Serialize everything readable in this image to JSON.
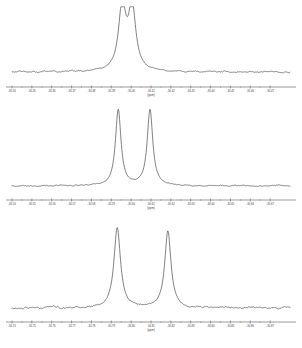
{
  "figure": {
    "background_color": "#ffffff",
    "trace_color": "#4a4a52",
    "axis_color": "#55555c",
    "width": 302,
    "height": 348
  },
  "chart_data": [
    {
      "type": "line",
      "name": "panel-top",
      "title": "",
      "xlabel": "(ppm)",
      "ylabel": "",
      "xlim": [
        -30.34,
        -30.48
      ],
      "ylim": [
        0,
        1.05
      ],
      "grid": false,
      "legend": "none",
      "axis_direction": "decreasing",
      "tick_labels": [
        "-30.34",
        "-30.35",
        "-30.36",
        "-30.37",
        "-30.38",
        "-30.39",
        "-30.40",
        "-30.41",
        "-30.42",
        "-30.43",
        "-30.44",
        "-30.45",
        "-30.46",
        "-30.47"
      ],
      "tick_positions": [
        -30.34,
        -30.35,
        -30.36,
        -30.37,
        -30.38,
        -30.39,
        -30.4,
        -30.41,
        -30.42,
        -30.43,
        -30.44,
        -30.45,
        -30.46,
        -30.47
      ],
      "peaks": [
        {
          "center": -30.3955,
          "height": 1.0,
          "width": 0.0022
        },
        {
          "center": -30.4005,
          "height": 0.98,
          "width": 0.0022
        }
      ],
      "baseline_noise_amplitude": 0.018,
      "description": "Closely spaced doublet, nearly merged, centered near -30.40 ppm"
    },
    {
      "type": "line",
      "name": "panel-middle",
      "title": "",
      "xlabel": "(ppm)",
      "ylabel": "",
      "xlim": [
        -30.54,
        -30.68
      ],
      "ylim": [
        0,
        1.05
      ],
      "grid": false,
      "legend": "none",
      "axis_direction": "decreasing",
      "tick_labels": [
        "-30.54",
        "-30.55",
        "-30.56",
        "-30.57",
        "-30.58",
        "-30.59",
        "-30.60",
        "-30.61",
        "-30.62",
        "-30.63",
        "-30.64",
        "-30.65",
        "-30.66",
        "-30.67"
      ],
      "tick_positions": [
        -30.54,
        -30.55,
        -30.56,
        -30.57,
        -30.58,
        -30.59,
        -30.6,
        -30.61,
        -30.62,
        -30.63,
        -30.64,
        -30.65,
        -30.66,
        -30.67
      ],
      "peaks": [
        {
          "center": -30.5935,
          "height": 1.0,
          "width": 0.0017
        },
        {
          "center": -30.6095,
          "height": 1.0,
          "width": 0.0017
        }
      ],
      "baseline_noise_amplitude": 0.012,
      "description": "Two resolved sharp peaks of equal height separated by about 0.016 ppm"
    },
    {
      "type": "line",
      "name": "panel-bottom",
      "title": "",
      "xlabel": "(ppm)",
      "ylabel": "",
      "xlim": [
        -30.74,
        -30.88
      ],
      "ylim": [
        0,
        1.05
      ],
      "grid": false,
      "legend": "none",
      "axis_direction": "decreasing",
      "tick_labels": [
        "-30.74",
        "-30.75",
        "-30.76",
        "-30.77",
        "-30.78",
        "-30.79",
        "-30.80",
        "-30.81",
        "-30.82",
        "-30.83",
        "-30.84",
        "-30.85",
        "-30.86",
        "-30.87"
      ],
      "tick_positions": [
        -30.74,
        -30.75,
        -30.76,
        -30.77,
        -30.78,
        -30.79,
        -30.8,
        -30.81,
        -30.82,
        -30.83,
        -30.84,
        -30.85,
        -30.86,
        -30.87
      ],
      "peaks": [
        {
          "center": -30.793,
          "height": 1.0,
          "width": 0.002
        },
        {
          "center": -30.8185,
          "height": 0.96,
          "width": 0.0019
        }
      ],
      "baseline_noise_amplitude": 0.02,
      "description": "Two broad resolved peaks, the left slightly taller, separated by about 0.026 ppm"
    }
  ]
}
